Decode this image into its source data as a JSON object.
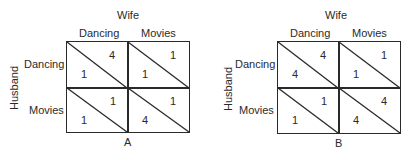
{
  "matrices": [
    {
      "id": "A",
      "column_player": "Wife",
      "row_player": "Husband",
      "columns": [
        "Dancing",
        "Movies"
      ],
      "rows": [
        "Dancing",
        "Movies"
      ],
      "label": "A",
      "cells": [
        [
          {
            "wife": "4",
            "husband": "1"
          },
          {
            "wife": "1",
            "husband": "1"
          }
        ],
        [
          {
            "wife": "1",
            "husband": "1"
          },
          {
            "wife": "1",
            "husband": "4"
          }
        ]
      ]
    },
    {
      "id": "B",
      "column_player": "Wife",
      "row_player": "Husband",
      "columns": [
        "Dancing",
        "Movies"
      ],
      "rows": [
        "Dancing",
        "Movies"
      ],
      "label": "B",
      "cells": [
        [
          {
            "wife": "4",
            "husband": "4"
          },
          {
            "wife": "1",
            "husband": "1"
          }
        ],
        [
          {
            "wife": "1",
            "husband": "1"
          },
          {
            "wife": "4",
            "husband": "4"
          }
        ]
      ]
    }
  ]
}
